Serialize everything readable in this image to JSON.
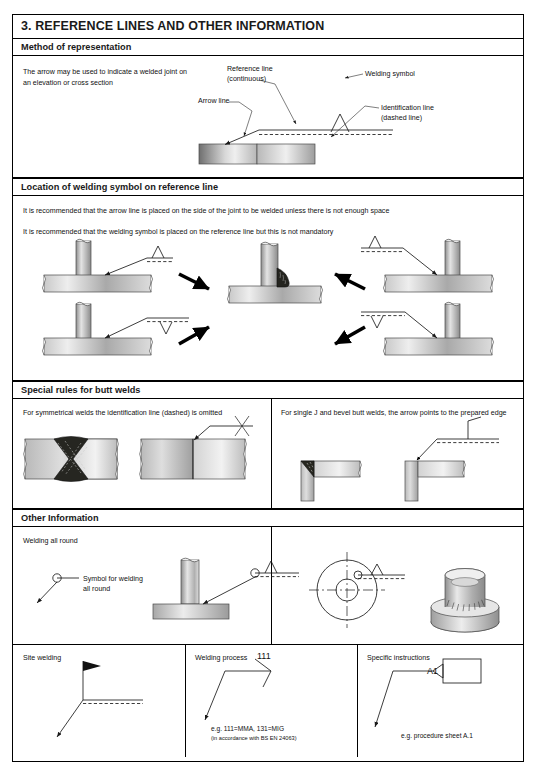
{
  "document": {
    "section_number": "3.",
    "title": "3. REFERENCE LINES AND OTHER INFORMATION"
  },
  "sections": {
    "method": {
      "band": "Method of representation",
      "intro": "The arrow may be used to indicate a welded joint on an elevation or cross section",
      "labels": {
        "reference_line": "Reference line",
        "reference_line_sub": "(continuous)",
        "arrow_line": "Arrow line",
        "welding_symbol": "Welding symbol",
        "identification_line": "Identification line",
        "identification_line_sub": "(dashed line)"
      }
    },
    "location": {
      "band": "Location of welding symbol on reference line",
      "rule_1": "It is recommended that the arrow line is placed on the side of the joint to be welded unless there is not enough space",
      "rule_2": "It is recommended that the welding symbol is placed on the reference line but this is not mandatory"
    },
    "butt": {
      "band": "Special rules for butt welds",
      "left_text": "For symmetrical welds the identification line (dashed) is omitted",
      "right_text": "For single J and bevel butt welds, the arrow points to the prepared edge"
    },
    "other": {
      "band": "Other Information",
      "all_round_title": "Welding all round",
      "all_round_label_1": "Symbol for welding",
      "all_round_label_2": "all round"
    },
    "bottom": {
      "site_welding": {
        "title": "Site welding"
      },
      "welding_process": {
        "title": "Welding process",
        "code": "111",
        "note": "e.g. 111=MMA, 131=MIG",
        "standard": "(in accordance with BS EN 24063)"
      },
      "specific_instructions": {
        "title": "Specific instructions",
        "tag": "A1",
        "note": "e.g. procedure sheet A.1"
      }
    }
  },
  "colors": {
    "ink": "#1a1a1a",
    "rule": "#000000",
    "steel_light": "#f2f2f2",
    "steel_mid": "#9a9a9a",
    "steel_dark": "#5a5a5a",
    "weld_bead": "#20201e"
  }
}
